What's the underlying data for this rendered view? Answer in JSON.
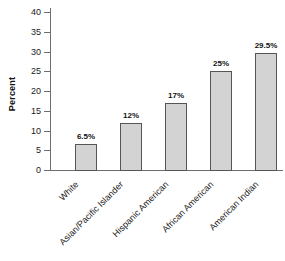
{
  "chart_data": {
    "type": "bar",
    "title": "",
    "subtitle": "",
    "xlabel": "",
    "ylabel": "Percent",
    "ylim": [
      0,
      40
    ],
    "ytick_interval": 5,
    "yticks": [
      0,
      5,
      10,
      15,
      20,
      25,
      30,
      35,
      40
    ],
    "ytick_labels": [
      "0",
      "5",
      "10",
      "15",
      "20",
      "25",
      "30",
      "35",
      "40"
    ],
    "grid": false,
    "legend": false,
    "legend_position": "none",
    "categories": [
      "White",
      "Asian/Pacific Islander",
      "Hispanic American",
      "African American",
      "American Indian"
    ],
    "values": [
      6.5,
      12,
      17,
      25,
      29.5
    ],
    "value_labels": [
      "6.5%",
      "12%",
      "17%",
      "25%",
      "29.5%"
    ],
    "xtick_label_rotation_deg": 45,
    "colors": {
      "bar_fill": "#d3d3d3",
      "bar_border": "#555555",
      "axis": "#6e6e6e",
      "text": "#1a1a1a",
      "background": "#ffffff"
    }
  }
}
